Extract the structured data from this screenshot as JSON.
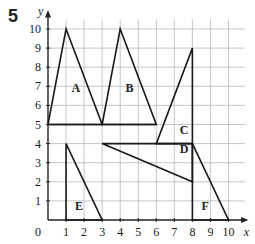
{
  "question_number": "5",
  "axes": {
    "x_label": "x",
    "y_label": "y",
    "origin_label": "0",
    "x_ticks": [
      "1",
      "2",
      "3",
      "4",
      "5",
      "6",
      "7",
      "8",
      "9",
      "10"
    ],
    "y_ticks": [
      "1",
      "2",
      "3",
      "4",
      "5",
      "6",
      "7",
      "8",
      "9",
      "10"
    ]
  },
  "shapes": [
    {
      "label": "A",
      "points": [
        [
          0,
          5
        ],
        [
          1,
          10
        ],
        [
          3,
          5
        ]
      ],
      "label_pos": [
        1.3,
        6.7
      ]
    },
    {
      "label": "B",
      "points": [
        [
          3,
          5
        ],
        [
          4,
          10
        ],
        [
          6,
          5
        ]
      ],
      "label_pos": [
        4.3,
        6.7
      ]
    },
    {
      "label": "C",
      "points": [
        [
          6,
          4
        ],
        [
          8,
          9
        ],
        [
          8,
          4
        ]
      ],
      "label_pos": [
        7.3,
        4.5
      ]
    },
    {
      "label": "D",
      "points": [
        [
          3,
          4
        ],
        [
          8,
          4
        ],
        [
          8,
          2
        ]
      ],
      "label_pos": [
        7.3,
        3.5
      ]
    },
    {
      "label": "E",
      "points": [
        [
          1,
          0
        ],
        [
          1,
          4
        ],
        [
          3,
          0
        ]
      ],
      "label_pos": [
        1.5,
        0.5
      ]
    },
    {
      "label": "F",
      "points": [
        [
          8,
          0
        ],
        [
          8,
          4
        ],
        [
          10,
          0
        ]
      ],
      "label_pos": [
        8.5,
        0.5
      ]
    }
  ],
  "base_line": [
    [
      0,
      5
    ],
    [
      6,
      5
    ]
  ],
  "colors": {
    "grid": "#b8b8b8",
    "axis": "#222222",
    "shape": "#1a1a1a",
    "text": "#222222"
  }
}
